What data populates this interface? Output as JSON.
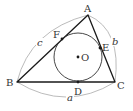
{
  "diagram": {
    "vertices": [
      {
        "id": "A",
        "label": "A",
        "x": 88,
        "y": 15
      },
      {
        "id": "B",
        "label": "B",
        "x": 17,
        "y": 82
      },
      {
        "id": "C",
        "label": "C",
        "x": 115,
        "y": 82
      }
    ],
    "incircle": {
      "center_label": "O",
      "cx": 78,
      "cy": 57,
      "r": 24
    },
    "tangent_points": [
      {
        "id": "D",
        "label": "D",
        "side": "BC"
      },
      {
        "id": "E",
        "label": "E",
        "side": "CA"
      },
      {
        "id": "F",
        "label": "F",
        "side": "AB"
      }
    ],
    "side_lengths": [
      {
        "label": "a",
        "side": "BC"
      },
      {
        "label": "b",
        "side": "CA"
      },
      {
        "label": "c",
        "side": "AB"
      }
    ],
    "colors": {
      "stroke": "#1a1a1a",
      "arc": "#999999",
      "text": "#333333"
    }
  }
}
